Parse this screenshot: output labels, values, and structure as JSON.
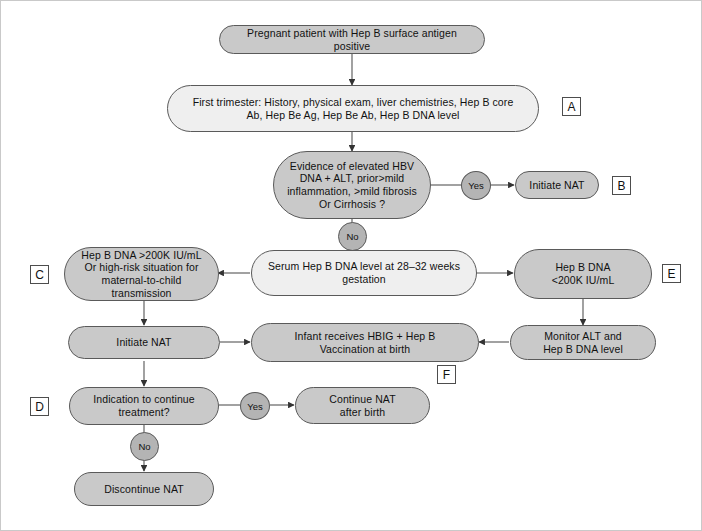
{
  "diagram": {
    "title_alt": "Hepatitis B in pregnancy management algorithm",
    "colors": {
      "node_fill_gray": "#c9c9c9",
      "node_fill_light": "#efefef",
      "decision_fill": "#b4b4b4",
      "stroke": "#5a5a5a",
      "text": "#111111",
      "frame": "#c9c9c9"
    },
    "nodes": {
      "start": {
        "lines": [
          "Pregnant patient with Hep B surface antigen positive"
        ]
      },
      "first_trimester": {
        "lines": [
          "First trimester: History, physical exam, liver chemistries, Hep B core",
          "Ab, Hep Be Ag, Hep Be Ab, Hep B DNA level"
        ]
      },
      "evidence": {
        "lines": [
          "Evidence of elevated HBV",
          "DNA + ALT, prior>mild",
          "inflammation, >mild fibrosis",
          "Or Cirrhosis ?"
        ]
      },
      "initiate_nat_b": {
        "lines": [
          "Initiate NAT"
        ]
      },
      "serum_level": {
        "lines": [
          "Serum Hep B DNA level at 28–32 weeks",
          "gestation"
        ]
      },
      "high_dna": {
        "lines": [
          "Hep B DNA >200K IU/mL",
          "Or high-risk situation for",
          "maternal-to-child transmission"
        ]
      },
      "low_dna": {
        "lines": [
          "Hep B DNA",
          "<200K IU/mL"
        ]
      },
      "initiate_nat_left": {
        "lines": [
          "Initiate NAT"
        ]
      },
      "infant": {
        "lines": [
          "Infant receives HBIG + Hep B",
          "Vaccination at birth"
        ]
      },
      "monitor": {
        "lines": [
          "Monitor ALT and",
          "Hep B DNA level"
        ]
      },
      "indication": {
        "lines": [
          "Indication to continue",
          "treatment?"
        ]
      },
      "continue_nat": {
        "lines": [
          "Continue NAT",
          "after birth"
        ]
      },
      "discontinue_nat": {
        "lines": [
          "Discontinue NAT"
        ]
      }
    },
    "edge_labels": {
      "evidence_yes": "Yes",
      "evidence_no": "No",
      "indication_yes": "Yes",
      "indication_no": "No"
    },
    "tags": {
      "a": "A",
      "b": "B",
      "c": "C",
      "d": "D",
      "e": "E",
      "f": "F"
    }
  }
}
